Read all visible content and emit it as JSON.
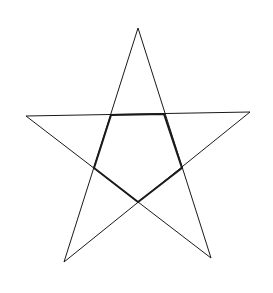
{
  "diagram": {
    "title": "",
    "shape": "pentagram",
    "background_color": "#ffffff",
    "stroke_color": "#1a1a1a",
    "outer_stroke_width": 1,
    "inner_stroke_width": 2,
    "outer_points": [
      {
        "name": "top",
        "x": 138,
        "y": 28
      },
      {
        "name": "right",
        "x": 250,
        "y": 112
      },
      {
        "name": "bottom-right",
        "x": 211,
        "y": 258
      },
      {
        "name": "bottom-left",
        "x": 64,
        "y": 262
      },
      {
        "name": "left",
        "x": 26,
        "y": 116
      }
    ],
    "star_order": [
      "top",
      "bottom-left",
      "right",
      "left",
      "bottom-right"
    ],
    "inner_pentagon": [
      {
        "name": "inner-top-left",
        "x": 111,
        "y": 115
      },
      {
        "name": "inner-top-right",
        "x": 164,
        "y": 114
      },
      {
        "name": "inner-right",
        "x": 182,
        "y": 168
      },
      {
        "name": "inner-bottom",
        "x": 138,
        "y": 202
      },
      {
        "name": "inner-left",
        "x": 94,
        "y": 168
      }
    ]
  }
}
